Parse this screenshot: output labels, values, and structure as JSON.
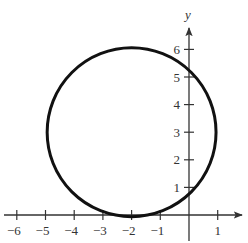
{
  "chart_data": {
    "type": "line",
    "title": "",
    "xlabel": "",
    "ylabel": "y",
    "xlim": [
      -6.2,
      1.6
    ],
    "ylim": [
      -0.5,
      7
    ],
    "grid": false,
    "x_ticks": [
      -6,
      -5,
      -4,
      -3,
      -2,
      -1,
      1
    ],
    "x_tick_labels": [
      "−6",
      "−5",
      "−4",
      "−3",
      "−2",
      "−1",
      "1"
    ],
    "y_ticks": [
      1,
      2,
      3,
      4,
      5,
      6
    ],
    "y_tick_labels": [
      "1",
      "2",
      "3",
      "4",
      "5",
      "6"
    ],
    "series": [
      {
        "name": "circle",
        "shape": "circle",
        "center": [
          -2,
          3
        ],
        "radius": 3,
        "equation": "(x + 2)^2 + (y - 3)^2 = 9",
        "color": "#111111"
      }
    ]
  },
  "axes": {
    "y_name": "y",
    "color": "#333333"
  }
}
